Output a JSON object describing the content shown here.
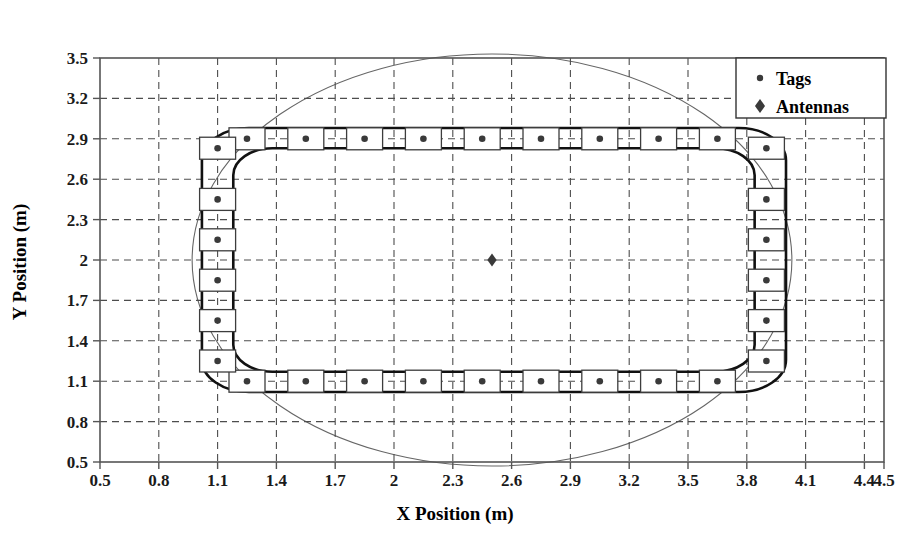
{
  "chart_data": {
    "type": "scatter",
    "title": "",
    "xlabel": "X Position (m)",
    "ylabel": "Y Position (m)",
    "xlim": [
      0.5,
      4.5
    ],
    "ylim": [
      0.5,
      3.5
    ],
    "xticks": [
      "0.5",
      "0.8",
      "1.1",
      "1.4",
      "1.7",
      "2",
      "2.3",
      "2.6",
      "2.9",
      "3.2",
      "3.5",
      "3.8",
      "4.1",
      "4.4",
      "4.5"
    ],
    "xtick_values": [
      0.5,
      0.8,
      1.1,
      1.4,
      1.7,
      2.0,
      2.3,
      2.6,
      2.9,
      3.2,
      3.5,
      3.8,
      4.1,
      4.4,
      4.5
    ],
    "yticks": [
      "0.5",
      "0.8",
      "1.1",
      "1.4",
      "1.7",
      "2",
      "2.3",
      "2.6",
      "2.9",
      "3.2",
      "3.5"
    ],
    "ytick_values": [
      0.5,
      0.8,
      1.1,
      1.4,
      1.7,
      2.0,
      2.3,
      2.6,
      2.9,
      3.2,
      3.5
    ],
    "grid": true,
    "legend_position": "top-right",
    "legend": [
      {
        "label": "Tags",
        "marker": "circle"
      },
      {
        "label": "Antennas",
        "marker": "diamond"
      }
    ],
    "series": [
      {
        "name": "Tags",
        "marker": "circle",
        "points": [
          {
            "x": 1.25,
            "y": 2.9
          },
          {
            "x": 1.55,
            "y": 2.9
          },
          {
            "x": 1.85,
            "y": 2.9
          },
          {
            "x": 2.15,
            "y": 2.9
          },
          {
            "x": 2.45,
            "y": 2.9
          },
          {
            "x": 2.75,
            "y": 2.9
          },
          {
            "x": 3.05,
            "y": 2.9
          },
          {
            "x": 3.35,
            "y": 2.9
          },
          {
            "x": 3.65,
            "y": 2.9
          },
          {
            "x": 1.25,
            "y": 1.1
          },
          {
            "x": 1.55,
            "y": 1.1
          },
          {
            "x": 1.85,
            "y": 1.1
          },
          {
            "x": 2.15,
            "y": 1.1
          },
          {
            "x": 2.45,
            "y": 1.1
          },
          {
            "x": 2.75,
            "y": 1.1
          },
          {
            "x": 3.05,
            "y": 1.1
          },
          {
            "x": 3.35,
            "y": 1.1
          },
          {
            "x": 3.65,
            "y": 1.1
          },
          {
            "x": 1.1,
            "y": 2.83
          },
          {
            "x": 1.1,
            "y": 2.45
          },
          {
            "x": 1.1,
            "y": 2.15
          },
          {
            "x": 1.1,
            "y": 1.85
          },
          {
            "x": 1.1,
            "y": 1.55
          },
          {
            "x": 1.1,
            "y": 1.25
          },
          {
            "x": 3.9,
            "y": 2.83
          },
          {
            "x": 3.9,
            "y": 2.45
          },
          {
            "x": 3.9,
            "y": 2.15
          },
          {
            "x": 3.9,
            "y": 1.85
          },
          {
            "x": 3.9,
            "y": 1.55
          },
          {
            "x": 3.9,
            "y": 1.25
          }
        ]
      },
      {
        "name": "Antennas",
        "marker": "diamond",
        "points": [
          {
            "x": 2.5,
            "y": 2.0
          }
        ]
      }
    ],
    "shapes": [
      {
        "name": "outer-track-rectangle",
        "type": "rounded-rect",
        "x0": 1.02,
        "y0": 1.02,
        "x1": 4.0,
        "y1": 2.98,
        "corner_radius": 0.24
      },
      {
        "name": "inner-track-rectangle",
        "type": "rounded-rect",
        "x0": 1.18,
        "y0": 1.17,
        "x1": 3.84,
        "y1": 2.83,
        "corner_radius": 0.2
      },
      {
        "name": "coverage-circle",
        "type": "circle",
        "cx": 2.5,
        "cy": 2.0,
        "r": 1.53
      }
    ]
  },
  "colors": {
    "axis": "#555555",
    "grid": "#4d4d4d",
    "marker": "#3a3a3a",
    "track": "#111111",
    "circle": "#666666",
    "background": "#ffffff"
  }
}
